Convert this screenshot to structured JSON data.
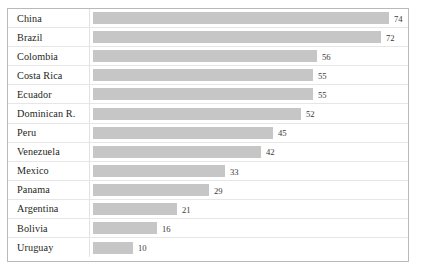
{
  "chart_data": {
    "type": "bar",
    "orientation": "horizontal",
    "title": "",
    "subtitle": "",
    "xlabel": "",
    "ylabel": "",
    "grid": false,
    "legend": null,
    "xlim": [
      0,
      80
    ],
    "categories": [
      "China",
      "Brazil",
      "Colombia",
      "Costa Rica",
      "Ecuador",
      "Dominican R.",
      "Peru",
      "Venezuela",
      "Mexico",
      "Panama",
      "Argentina",
      "Bolivia",
      "Uruguay"
    ],
    "values": [
      74,
      72,
      56,
      55,
      55,
      52,
      45,
      42,
      33,
      29,
      21,
      16,
      10
    ],
    "value_labels": [
      "74",
      "72",
      "56",
      "55",
      "55",
      "52",
      "45",
      "42",
      "33",
      "29",
      "21",
      "16",
      "10"
    ],
    "bar_color": "#c6c6c6",
    "text_color": "#231f20",
    "border_color": "#b9b9b9",
    "row_separator_color": "#e6e6e6"
  },
  "rows": [
    {
      "label": "China",
      "value": 74,
      "value_label": "74"
    },
    {
      "label": "Brazil",
      "value": 72,
      "value_label": "72"
    },
    {
      "label": "Colombia",
      "value": 56,
      "value_label": "56"
    },
    {
      "label": "Costa Rica",
      "value": 55,
      "value_label": "55"
    },
    {
      "label": "Ecuador",
      "value": 55,
      "value_label": "55"
    },
    {
      "label": "Dominican R.",
      "value": 52,
      "value_label": "52"
    },
    {
      "label": "Peru",
      "value": 45,
      "value_label": "45"
    },
    {
      "label": "Venezuela",
      "value": 42,
      "value_label": "42"
    },
    {
      "label": "Mexico",
      "value": 33,
      "value_label": "33"
    },
    {
      "label": "Panama",
      "value": 29,
      "value_label": "29"
    },
    {
      "label": "Argentina",
      "value": 21,
      "value_label": "21"
    },
    {
      "label": "Bolivia",
      "value": 16,
      "value_label": "16"
    },
    {
      "label": "Uruguay",
      "value": 10,
      "value_label": "10"
    }
  ],
  "scale": {
    "px_per_unit": 4.0
  }
}
